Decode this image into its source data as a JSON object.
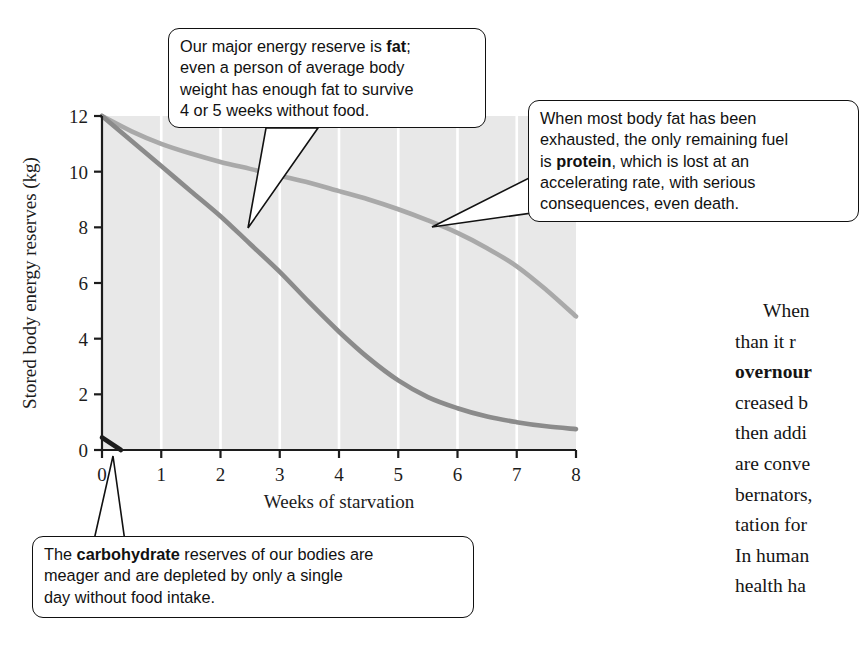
{
  "chart_data": {
    "type": "line",
    "title": "",
    "xlabel": "Weeks of starvation",
    "ylabel": "Stored body energy reserves (kg)",
    "xlim": [
      0,
      8
    ],
    "ylim": [
      0,
      12
    ],
    "xticks": [
      "0",
      "1",
      "2",
      "3",
      "4",
      "5",
      "6",
      "7",
      "8"
    ],
    "yticks": [
      "0",
      "2",
      "4",
      "6",
      "8",
      "10",
      "12"
    ],
    "grid": "vertical white gridlines on light gray panel",
    "legend": "none",
    "plot_bgcolor": "#e8e8e8",
    "gridline_color": "#ffffff",
    "axis_color": "#1c1c1c",
    "series": [
      {
        "name": "fat",
        "color": "#a9a9a9",
        "x": [
          0,
          0.5,
          1,
          1.5,
          2,
          2.5,
          3,
          3.5,
          4,
          4.5,
          5,
          5.5,
          6,
          6.5,
          7,
          7.5,
          8
        ],
        "values": [
          12.0,
          11.45,
          11.0,
          10.65,
          10.35,
          10.1,
          9.85,
          9.6,
          9.3,
          9.0,
          8.65,
          8.25,
          7.8,
          7.25,
          6.6,
          5.75,
          4.8
        ]
      },
      {
        "name": "protein",
        "color": "#8b8b8b",
        "x": [
          0,
          0.5,
          1,
          1.5,
          2,
          2.5,
          3,
          3.5,
          4,
          4.5,
          5,
          5.5,
          6,
          6.5,
          7,
          7.5,
          8
        ],
        "values": [
          12.0,
          11.1,
          10.2,
          9.3,
          8.4,
          7.4,
          6.4,
          5.3,
          4.25,
          3.3,
          2.5,
          1.9,
          1.5,
          1.2,
          1.0,
          0.85,
          0.75
        ]
      },
      {
        "name": "carbohydrate",
        "color": "#1c1c1c",
        "x": [
          0,
          0.32
        ],
        "values": [
          0.45,
          0.0
        ]
      }
    ]
  },
  "callouts": {
    "fat": {
      "name": "fat-callout",
      "lines": [
        {
          "pre": "Our major energy reserve is ",
          "bold": "fat",
          "post": ";"
        },
        {
          "pre": "even a person of average body",
          "bold": "",
          "post": ""
        },
        {
          "pre": "weight has enough fat to survive",
          "bold": "",
          "post": ""
        },
        {
          "pre": "4 or 5 weeks without food.",
          "bold": "",
          "post": ""
        }
      ]
    },
    "protein": {
      "name": "protein-callout",
      "lines": [
        {
          "pre": "When most body fat has been",
          "bold": "",
          "post": ""
        },
        {
          "pre": "exhausted, the only remaining fuel",
          "bold": "",
          "post": ""
        },
        {
          "pre": "is ",
          "bold": "protein",
          "post": ", which is lost at an"
        },
        {
          "pre": "accelerating rate, with serious",
          "bold": "",
          "post": ""
        },
        {
          "pre": "consequences, even death.",
          "bold": "",
          "post": ""
        }
      ]
    },
    "carbohydrate": {
      "name": "carbohydrate-callout",
      "lines": [
        {
          "pre": "The ",
          "bold": "carbohydrate",
          "post": " reserves of our bodies are"
        },
        {
          "pre": "meager and are depleted by only a single",
          "bold": "",
          "post": ""
        },
        {
          "pre": "day without food intake.",
          "bold": "",
          "post": ""
        }
      ]
    }
  },
  "body_text": {
    "lines": [
      {
        "indent": true,
        "pre": "When ",
        "bold": "",
        "post": ""
      },
      {
        "indent": false,
        "pre": "than it r",
        "bold": "",
        "post": ""
      },
      {
        "indent": false,
        "pre": "",
        "bold": "overnour",
        "post": ""
      },
      {
        "indent": false,
        "pre": "creased b",
        "bold": "",
        "post": ""
      },
      {
        "indent": false,
        "pre": "then addi",
        "bold": "",
        "post": ""
      },
      {
        "indent": false,
        "pre": "are conve",
        "bold": "",
        "post": ""
      },
      {
        "indent": false,
        "pre": "bernators,",
        "bold": "",
        "post": ""
      },
      {
        "indent": false,
        "pre": "tation for",
        "bold": "",
        "post": ""
      },
      {
        "indent": false,
        "pre": "In human",
        "bold": "",
        "post": ""
      },
      {
        "indent": false,
        "pre": "health ha",
        "bold": "",
        "post": ""
      }
    ]
  }
}
